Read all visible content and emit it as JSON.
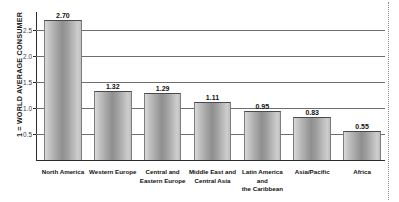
{
  "chart_data": {
    "type": "bar",
    "title": "",
    "subtitle": "",
    "xlabel": "",
    "ylabel": "1 = WORLD AVERAGE CONSUMER",
    "ylim": [
      0,
      2.85
    ],
    "grid": true,
    "legend": "none",
    "categories": [
      "North America",
      "Western Europe",
      "Central and\nEastern Europe",
      "Middle East and\nCentral Asia",
      "Latin America and\nthe Caribbean",
      "Asia/Pacific",
      "Africa"
    ],
    "values": [
      2.7,
      1.32,
      1.29,
      1.11,
      0.95,
      0.83,
      0.55
    ],
    "value_labels": [
      "2.70",
      "1.32",
      "1.29",
      "1.11",
      "0.95",
      "0.83",
      "0.55"
    ],
    "yticks": [
      0.5,
      1.0,
      1.5,
      2.0,
      2.5
    ],
    "ytick_labels": [
      "0.5",
      "1.0",
      "1.5",
      "2.0",
      "2.5"
    ],
    "colors": {
      "bar_light": "#d9d9d9",
      "bar_mid": "#8f8f8f",
      "bar_edge": "#7d7d7d",
      "axis": "#2b2b2b",
      "grid": "#6e6e6e",
      "text": "#111111",
      "background": "#ffffff",
      "dotted_rule": "#8a8a8a"
    }
  }
}
